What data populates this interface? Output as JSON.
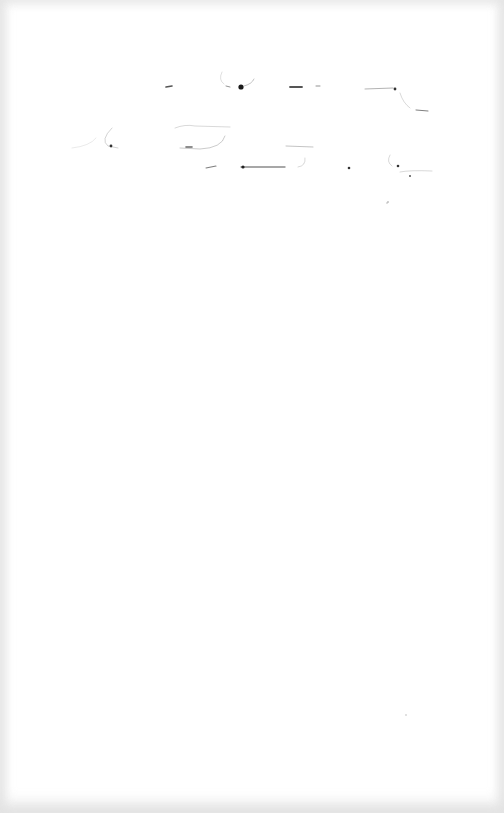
{
  "page": {
    "type": "scanned-page",
    "background_color": "#ffffff",
    "ink_color": "#222222",
    "legible_text": ""
  },
  "handwriting": {
    "region": "top",
    "line_count": 3,
    "legible": false
  }
}
